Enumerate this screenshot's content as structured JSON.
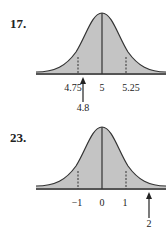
{
  "figures": [
    {
      "number": "17.",
      "mean_label": "5",
      "left_label": "4.75",
      "right_label": "5.25",
      "arrow_label": "4.8",
      "arrow_value": 4.8
    },
    {
      "number": "23.",
      "mean_label": "0",
      "left_label": "−1",
      "right_label": "1",
      "arrow_label": "2",
      "arrow_value": 2
    }
  ],
  "colors": {
    "fill": "#c4c4c4",
    "stroke": "#333333",
    "axis": "#555555"
  }
}
